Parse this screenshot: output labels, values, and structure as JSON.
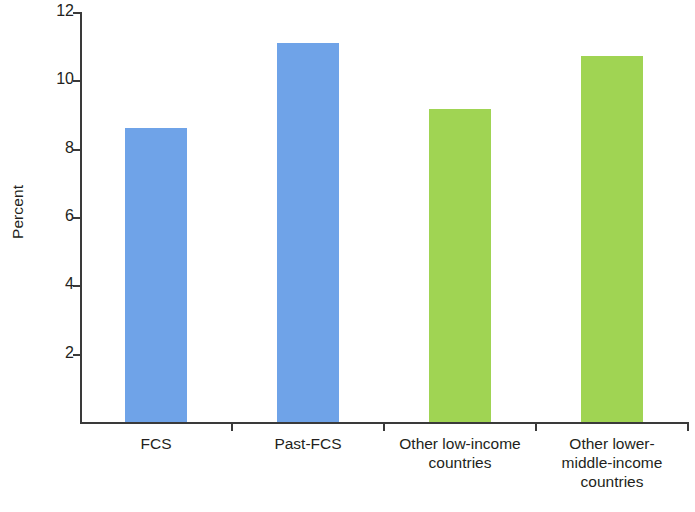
{
  "chart_data": {
    "type": "bar",
    "title": "",
    "xlabel": "",
    "ylabel": "Percent",
    "ylim": [
      0,
      12
    ],
    "grid": false,
    "legend": "none",
    "categories": [
      "FCS",
      "Past-FCS",
      "Other low-income\ncountries",
      "Other lower-\nmiddle-income\ncountries"
    ],
    "values": [
      8.6,
      11.1,
      9.15,
      10.7
    ],
    "bar_colors": [
      "#6fa3e8",
      "#6fa3e8",
      "#a0d453",
      "#a0d453"
    ],
    "y_ticks": [
      2,
      4,
      6,
      8,
      10,
      12
    ],
    "y_tick_labels": [
      "2",
      "4",
      "6",
      "8",
      "10",
      "12"
    ],
    "axis_color": "#3a3a3a",
    "background_color": "#ffffff",
    "series": [
      {
        "name": "Percent",
        "values": [
          8.6,
          11.1,
          9.15,
          10.7
        ]
      }
    ]
  },
  "axes": {
    "y_title": "Percent"
  }
}
